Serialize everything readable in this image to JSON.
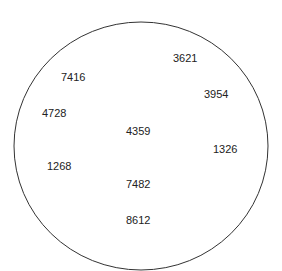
{
  "diagram": {
    "shape": "circle",
    "stroke_color": "#333333",
    "numbers": [
      {
        "value": "3621",
        "x": 173,
        "y": 55
      },
      {
        "value": "7416",
        "x": 61,
        "y": 74
      },
      {
        "value": "3954",
        "x": 204,
        "y": 91
      },
      {
        "value": "4728",
        "x": 42,
        "y": 110
      },
      {
        "value": "4359",
        "x": 126,
        "y": 128
      },
      {
        "value": "1326",
        "x": 213,
        "y": 146
      },
      {
        "value": "1268",
        "x": 47,
        "y": 163
      },
      {
        "value": "7482",
        "x": 126,
        "y": 181
      },
      {
        "value": "8612",
        "x": 126,
        "y": 217
      }
    ]
  }
}
